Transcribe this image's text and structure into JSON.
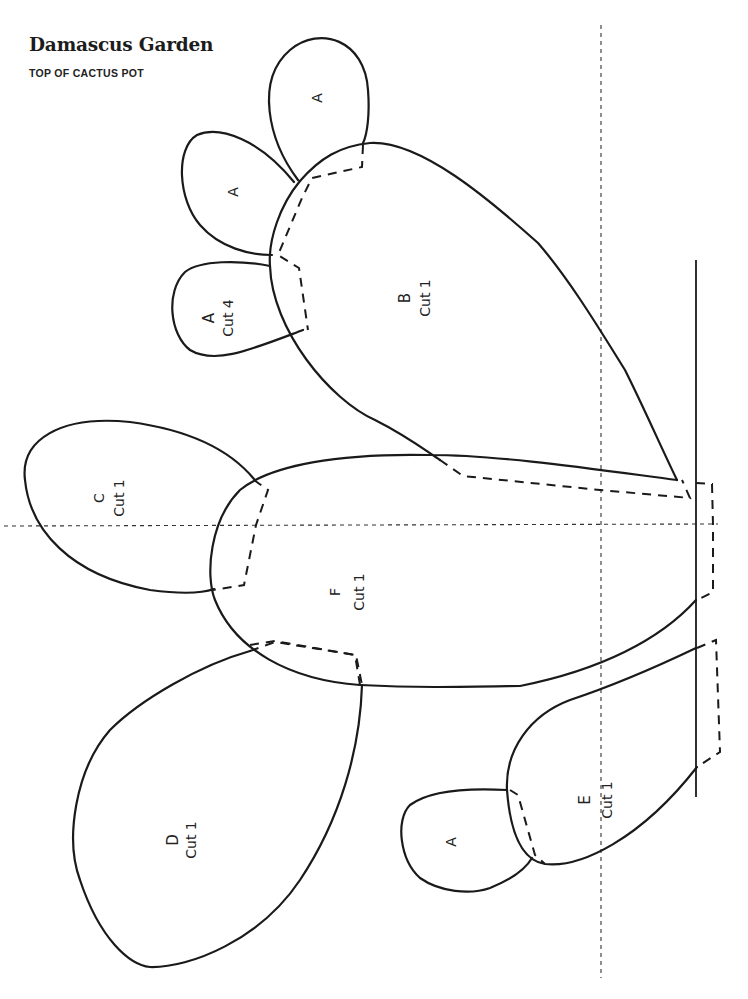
{
  "header": {
    "title": "Damascus Garden",
    "subtitle": "TOP OF CACTUS POT"
  },
  "pieces": [
    {
      "id": "A1",
      "letter": "A",
      "instruction": ""
    },
    {
      "id": "A2",
      "letter": "A",
      "instruction": ""
    },
    {
      "id": "A3",
      "letter": "A",
      "instruction": "Cut 4"
    },
    {
      "id": "B",
      "letter": "B",
      "instruction": "Cut 1"
    },
    {
      "id": "C",
      "letter": "C",
      "instruction": "Cut 1"
    },
    {
      "id": "F",
      "letter": "F",
      "instruction": "Cut 1"
    },
    {
      "id": "D",
      "letter": "D",
      "instruction": "Cut 1"
    },
    {
      "id": "E",
      "letter": "E",
      "instruction": "Cut 1"
    },
    {
      "id": "A4",
      "letter": "A",
      "instruction": ""
    }
  ],
  "legend": {
    "solid_line": "cut line",
    "dashed_line": "overlap / placement line",
    "dotted_line": "center guide line"
  },
  "colors": {
    "ink": "#1a1a1a",
    "paper": "#ffffff"
  }
}
